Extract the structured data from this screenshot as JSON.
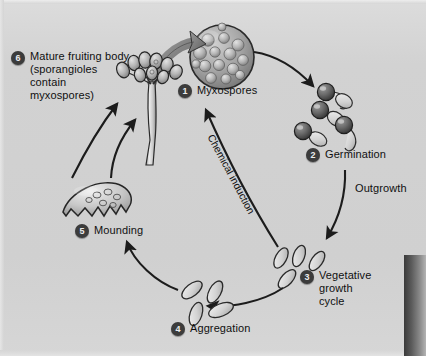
{
  "figure": {
    "background_color": "#d3d3d3",
    "ink_color": "#1a1a1a"
  },
  "stages": [
    {
      "number": "1",
      "label": "Myxospores",
      "icon": "myxospore-sphere-icon"
    },
    {
      "number": "2",
      "label": "Germination",
      "icon": "germinating-spores-icon"
    },
    {
      "number": "3",
      "label": "Vegetative\ngrowth\ncycle",
      "line1": "Vegetative",
      "line2": "growth",
      "line3": "cycle",
      "icon": "vegetative-rod-cells-icon"
    },
    {
      "number": "4",
      "label": "Aggregation",
      "icon": "aggregating-cells-icon"
    },
    {
      "number": "5",
      "label": "Mounding",
      "icon": "mound-amoeba-icon"
    },
    {
      "number": "6",
      "label": "Mature fruiting body\n(sporangioles\ncontain\nmyxospores)",
      "line1": "Mature fruiting body",
      "line2": "(sporangioles",
      "line3": "contain",
      "line4": "myxospores)",
      "icon": "fruiting-body-icon"
    }
  ],
  "transitions": [
    {
      "label": "Chemical induction",
      "name": "chemical-induction"
    },
    {
      "label": "Outgrowth",
      "name": "outgrowth"
    }
  ]
}
